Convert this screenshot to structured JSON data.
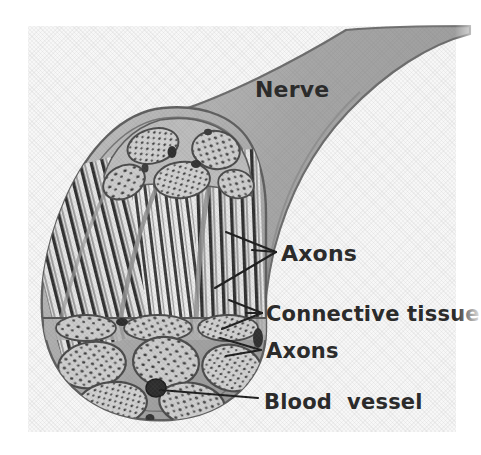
{
  "figure": {
    "kind": "anatomical-illustration",
    "background_color": "#ffffff",
    "scan_tint": "#f6f6f6"
  },
  "labels": {
    "nerve": "Nerve",
    "axons_upper": "Axons",
    "connective_tissue": "Connective tissue",
    "axons_lower": "Axons",
    "blood_vessel": "Blood  vessel"
  },
  "label_style": {
    "text_color": "#2b2b2b",
    "weight": "bold"
  },
  "structures": [
    {
      "name": "nerve-trunk",
      "label": "Nerve",
      "description": "Curved shaded nerve trunk extending to upper right",
      "fill": "#a8a8a8"
    },
    {
      "name": "epineurium-sheath",
      "label": "Connective tissue",
      "description": "Outer connective-tissue sheath enclosing the fascicles",
      "fill": "#b4b4b4"
    },
    {
      "name": "axon-bundles-longitudinal",
      "label": "Axons",
      "description": "Longitudinally cut striated axon bundles",
      "fill": "#4a4a4a"
    },
    {
      "name": "fascicles-cross-section",
      "label": "Axons",
      "description": "Fascicles in cross-section with dotted axon profiles",
      "fill": "#c9c9c9"
    },
    {
      "name": "blood-vessel",
      "label": "Blood  vessel",
      "description": "Small dark vessel lumen between fascicles",
      "fill": "#3a3a3a"
    }
  ],
  "leaders": [
    {
      "name": "leader-axons-upper",
      "style": "double-pronged",
      "targets": 2
    },
    {
      "name": "leader-connective-tissue",
      "style": "double-pronged",
      "targets": 2
    },
    {
      "name": "leader-axons-lower",
      "style": "double-pronged",
      "targets": 2
    },
    {
      "name": "leader-blood-vessel",
      "style": "single",
      "targets": 1
    }
  ]
}
